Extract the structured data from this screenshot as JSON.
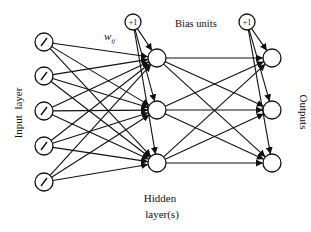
{
  "diagram": {
    "type": "neural-network",
    "labels": {
      "input_layer": "Input  layer",
      "bias_units": "Bias units",
      "weight": "w",
      "weight_sub": "ij",
      "hidden_line1": "Hidden",
      "hidden_line2": "layer(s)",
      "outputs": "Outputs",
      "bias_node": "+1"
    },
    "layers": {
      "input": [
        {
          "x": 44,
          "y": 42,
          "symbol": "/"
        },
        {
          "x": 44,
          "y": 76,
          "symbol": "/"
        },
        {
          "x": 44,
          "y": 111,
          "symbol": "/"
        },
        {
          "x": 44,
          "y": 146,
          "symbol": "/"
        },
        {
          "x": 44,
          "y": 182,
          "symbol": "/"
        }
      ],
      "hidden": [
        {
          "x": 157,
          "y": 58
        },
        {
          "x": 157,
          "y": 110
        },
        {
          "x": 157,
          "y": 163
        }
      ],
      "output": [
        {
          "x": 272,
          "y": 58
        },
        {
          "x": 272,
          "y": 110
        },
        {
          "x": 272,
          "y": 163
        }
      ],
      "bias": [
        {
          "x": 133,
          "y": 22,
          "targets": "hidden"
        },
        {
          "x": 247,
          "y": 22,
          "targets": "output"
        }
      ]
    },
    "colors": {
      "stroke": "#111111",
      "background": "#ffffff"
    }
  }
}
